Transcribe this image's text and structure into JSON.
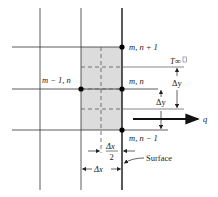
{
  "diagram": {
    "colors": {
      "grid_line": "#333333",
      "surface_line": "#222222",
      "control_volume_fill": "#dcdcdc",
      "dashed_line": "#555555",
      "node": "#000000",
      "text": "#222222"
    },
    "nodes": [
      {
        "id": "node-m-n-plus-1",
        "label": "m, n + 1"
      },
      {
        "id": "node-m-minus-1-n",
        "label": "m − 1, n"
      },
      {
        "id": "node-m-n",
        "label": "m, n"
      },
      {
        "id": "node-m-n-minus-1",
        "label": "m, n − 1"
      }
    ],
    "labels": {
      "t_inf": "T∞",
      "delta_y_upper": "Δy",
      "delta_y_lower": "Δy",
      "q": "q",
      "delta_x_half_num": "Δx",
      "delta_x_half_den": "2",
      "delta_x": "Δx",
      "surface": "Surface"
    }
  }
}
